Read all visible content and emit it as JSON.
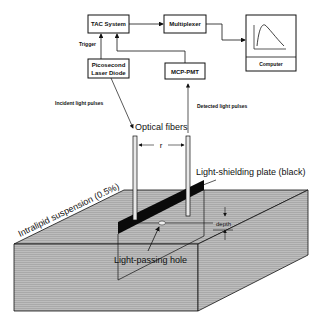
{
  "blocks": {
    "tac": "TAC System",
    "laser_line1": "Picosecond",
    "laser_line2": "Laser Diode",
    "multiplexer": "Multiplexer",
    "mcp_pmt": "MCP-PMT",
    "computer": "Computer"
  },
  "labels": {
    "trigger": "Trigger",
    "incident": "Incident light pulses",
    "detected": "Detected light pulses",
    "optical_fibers": "Optical fibers",
    "distance": "r",
    "shielding_plate": "Light-shielding plate (black)",
    "suspension": "Intralipid suspension (0.5%)",
    "depth": "depth",
    "hole": "Light-passing hole"
  },
  "colors": {
    "ink": "#111111",
    "medium_fill": "#b8b8b8",
    "medium_side": "#a8a8a8",
    "medium_top": "#c4c4c4",
    "plate": "#0a0a0a"
  }
}
